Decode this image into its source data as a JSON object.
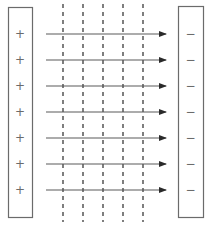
{
  "diagram": {
    "title": "",
    "left_plate": {
      "label": "positive-plate",
      "charges": [
        "+",
        "+",
        "+",
        "+",
        "+",
        "+",
        "+"
      ]
    },
    "right_plate": {
      "label": "negative-plate",
      "charges": [
        "−",
        "−",
        "−",
        "−",
        "−",
        "−",
        "−"
      ]
    },
    "field_lines": {
      "count": 7,
      "direction": "left-to-right"
    },
    "equipotential_lines": {
      "count": 5,
      "style": "dashed"
    },
    "colors": {
      "plate_stroke": "#6b6b6b",
      "field_line": "#5a5a5a",
      "equipotential": "#2a2a2a",
      "background": "#ffffff"
    }
  }
}
